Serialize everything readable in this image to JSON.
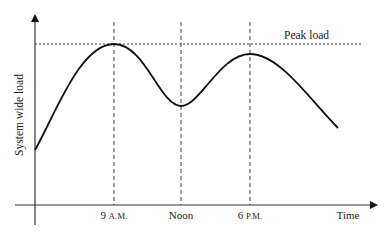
{
  "diagram": {
    "type": "line-curve",
    "title": "",
    "y_axis": {
      "label": "System wide load"
    },
    "x_axis": {
      "label": "Time"
    },
    "ticks": [
      {
        "num": "9 ",
        "suffix": "A.M.",
        "x": 114
      },
      {
        "num": "Noon",
        "suffix": "",
        "x": 181
      },
      {
        "num": "6 ",
        "suffix": "P.M.",
        "x": 250
      }
    ],
    "reference_line": {
      "label": "Peak load",
      "style": "dotted"
    },
    "curve_points": [
      {
        "x": 35,
        "y": 150
      },
      {
        "x": 114,
        "y": 44
      },
      {
        "x": 181,
        "y": 106
      },
      {
        "x": 250,
        "y": 54
      },
      {
        "x": 338,
        "y": 128
      }
    ],
    "colors": {
      "stroke": "#111111",
      "axis": "#333333",
      "guide": "#444444"
    }
  }
}
